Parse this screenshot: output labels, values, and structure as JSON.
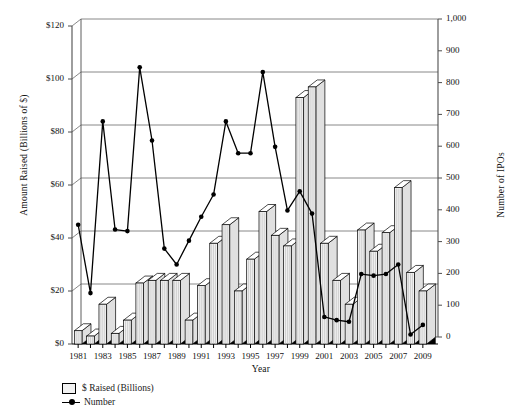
{
  "chart_data": {
    "type": "bar",
    "title": "",
    "xlabel": "Year",
    "ylabel": "Amount Raised (Billions of $)",
    "y2label": "Number of IPOs",
    "grid": true,
    "legend_position": "bottom-left",
    "ylim": [
      0,
      120
    ],
    "y2lim": [
      0,
      1000
    ],
    "yticks": [
      "$0",
      "$20",
      "$40",
      "$60",
      "$80",
      "$100",
      "$120"
    ],
    "ytick_values": [
      0,
      20,
      40,
      60,
      80,
      100,
      120
    ],
    "y2ticks": [
      "0",
      "100",
      "200",
      "300",
      "400",
      "500",
      "600",
      "700",
      "800",
      "900",
      "1,000"
    ],
    "y2tick_values": [
      0,
      100,
      200,
      300,
      400,
      500,
      600,
      700,
      800,
      900,
      1000
    ],
    "categories": [
      "1981",
      "1982",
      "1983",
      "1984",
      "1985",
      "1986",
      "1987",
      "1988",
      "1989",
      "1990",
      "1991",
      "1992",
      "1993",
      "1994",
      "1995",
      "1996",
      "1997",
      "1998",
      "1999",
      "2000",
      "2001",
      "2002",
      "2003",
      "2004",
      "2005",
      "2006",
      "2007",
      "2008",
      "2009"
    ],
    "xtick_labels": [
      "1981",
      "1983",
      "1985",
      "1987",
      "1989",
      "1991",
      "1993",
      "1995",
      "1997",
      "1999",
      "2001",
      "2003",
      "2005",
      "2007",
      "2009"
    ],
    "series": [
      {
        "name": "$ Raised (Billions)",
        "axis": "left",
        "type": "bar",
        "values": [
          5,
          3,
          15,
          4,
          9,
          23,
          24,
          24,
          24,
          9,
          22,
          38,
          45,
          20,
          32,
          50,
          41,
          37,
          93,
          97,
          38,
          24,
          15,
          43,
          35,
          42,
          59,
          27,
          20
        ]
      },
      {
        "name": "Number",
        "axis": "right",
        "type": "line",
        "values": [
          375,
          160,
          700,
          360,
          355,
          870,
          640,
          300,
          250,
          325,
          400,
          470,
          700,
          600,
          600,
          855,
          620,
          420,
          480,
          410,
          85,
          75,
          70,
          220,
          215,
          220,
          250,
          30,
          60
        ]
      }
    ]
  },
  "legend": {
    "items": [
      {
        "label": "$ Raised (Billions)",
        "marker": "square-swatch"
      },
      {
        "label": "Number",
        "marker": "line-dot"
      }
    ]
  },
  "colors": {
    "bar_face": "#f2f2f2",
    "bar_top": "#ffffff",
    "bar_side": "#e0e0e0",
    "bar_outline": "#000000",
    "line": "#000000",
    "grid": "#7a7a7a",
    "axis": "#4d4d4d",
    "text": "#111111",
    "background": "#ffffff"
  }
}
